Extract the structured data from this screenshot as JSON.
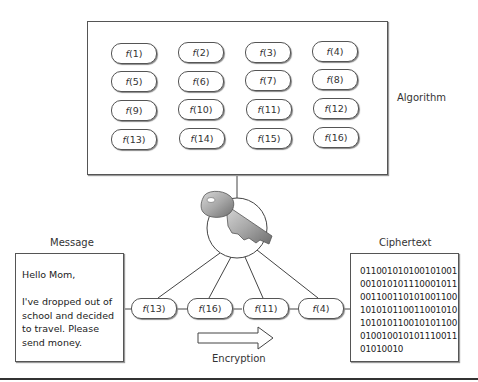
{
  "algorithm": {
    "label": "Algorithm",
    "functions": [
      {
        "name": "f",
        "arg": "(1)"
      },
      {
        "name": "f",
        "arg": "(2)"
      },
      {
        "name": "f",
        "arg": "(3)"
      },
      {
        "name": "f",
        "arg": "(4)"
      },
      {
        "name": "f",
        "arg": "(5)"
      },
      {
        "name": "f",
        "arg": "(6)"
      },
      {
        "name": "f",
        "arg": "(7)"
      },
      {
        "name": "f",
        "arg": "(8)"
      },
      {
        "name": "f",
        "arg": "(9)"
      },
      {
        "name": "f",
        "arg": "(10)"
      },
      {
        "name": "f",
        "arg": "(11)"
      },
      {
        "name": "f",
        "arg": "(12)"
      },
      {
        "name": "f",
        "arg": "(13)"
      },
      {
        "name": "f",
        "arg": "(14)"
      },
      {
        "name": "f",
        "arg": "(15)"
      },
      {
        "name": "f",
        "arg": "(16)"
      }
    ]
  },
  "key": {
    "icon": "key-icon"
  },
  "message": {
    "label": "Message",
    "lines": [
      "Hello Mom,",
      "",
      "I've dropped out of",
      "school and decided",
      "to travel. Please",
      "send money."
    ]
  },
  "chain": [
    {
      "name": "f",
      "arg": "(13)"
    },
    {
      "name": "f",
      "arg": "(16)"
    },
    {
      "name": "f",
      "arg": "(11)"
    },
    {
      "name": "f",
      "arg": "(4)"
    }
  ],
  "encryption": {
    "label": "Encryption",
    "icon": "right-arrow-icon"
  },
  "ciphertext": {
    "label": "Ciphertext",
    "lines": [
      "01100101010010100 1",
      "00101010111000101 1",
      "00110011010100110 0",
      "10101011001100101 0",
      "10101011001010110 0",
      "01001001010111001 1",
      "01010010"
    ]
  }
}
